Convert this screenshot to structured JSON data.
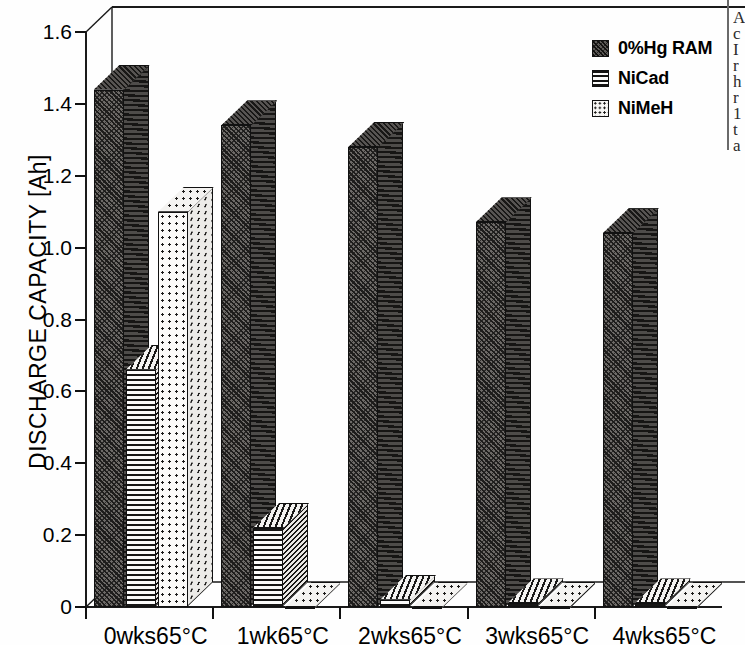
{
  "chart_data": {
    "type": "bar",
    "title": "",
    "xlabel": "",
    "ylabel": "DISCHARGE CAPACITY [Ah]",
    "categories": [
      "0wks65°C",
      "1wk65°C",
      "2wks65°C",
      "3wks65°C",
      "4wks65°C"
    ],
    "series": [
      {
        "name": "0%Hg RAM",
        "values": [
          1.44,
          1.34,
          1.28,
          1.07,
          1.04
        ]
      },
      {
        "name": "NiCad",
        "values": [
          0.66,
          0.22,
          0.02,
          0.01,
          0.01
        ]
      },
      {
        "name": "NiMeH",
        "values": [
          1.1,
          0.0,
          0.0,
          0.0,
          0.0
        ]
      }
    ],
    "ylim": [
      0,
      1.6
    ],
    "yticks": [
      0,
      0.2,
      0.4,
      0.6,
      0.8,
      1.0,
      1.2,
      1.4,
      1.6
    ],
    "ytick_labels": [
      "0",
      "0.2",
      "0.4",
      "0.6",
      "0.8",
      "1.0",
      "1.2",
      "1.4",
      "1.6"
    ],
    "grid": false,
    "legend_position": "top-right",
    "style": "3d-column"
  },
  "legend": {
    "items": [
      {
        "label": "0%Hg RAM",
        "pattern": "dark-diagonal-hatch"
      },
      {
        "label": "NiCad",
        "pattern": "horizontal-lines"
      },
      {
        "label": "NiMeH",
        "pattern": "dots"
      }
    ]
  },
  "gutter_text": [
    "A",
    "c",
    "I",
    "r",
    "h",
    "r",
    "1",
    "t",
    "a"
  ]
}
